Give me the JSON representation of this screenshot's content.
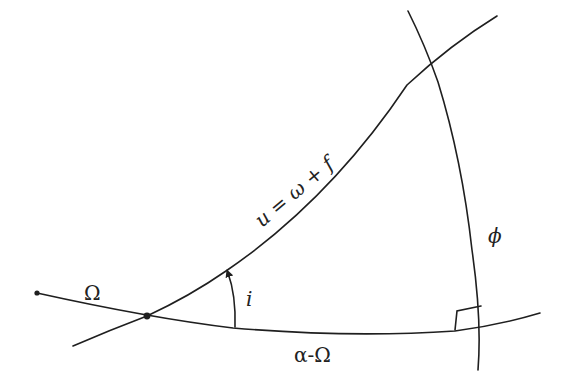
{
  "diagram": {
    "type": "spherical-triangle",
    "labels": {
      "ascending_node": "Ω",
      "inclination": "i",
      "argument_of_latitude": "u = ω + f",
      "latitude": "ϕ",
      "right_ascension_diff": "α-Ω"
    },
    "colors": {
      "stroke": "#1f1f1f",
      "background": "#ffffff",
      "text": "#222222"
    }
  }
}
